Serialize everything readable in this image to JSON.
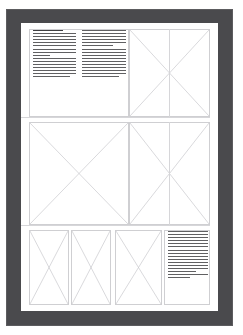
{
  "document": {
    "type": "page-layout-proof",
    "frame_color": "#4a4a4d",
    "page_color": "#ffffff",
    "guide_color": "#cfcfd2",
    "text_color": "#3d3d3f",
    "page_label": "",
    "canvas_width": 243,
    "canvas_height": 335
  },
  "text_blocks": [
    {
      "id": "top-left-column",
      "name": "body-column-left",
      "lines": [
        "How to build a team?",
        "The moment you start",
        "doing anything at all with",
        "another person, you've",
        "assembled a team. Begin",
        "a conversation, pick up",
        "the phone, brainstorm",
        "an idea and you're in",
        "teamwork.",
        "Start with Your ability to",
        "build better possibility",
        "is as leading the control",
        "to be versatile working",
        "longer on your ability to",
        "relate. But neither profit",
        "nor pressure are the"
      ]
    },
    {
      "id": "top-right-column",
      "name": "body-column-right",
      "lines": [
        "primary motivation for",
        "teamwork. Productive",
        "teamwork across our",
        "toward challenge,",
        "through design, with",
        "more confidence.",
        "Working well on any",
        "team generates energy",
        "and enthusiasm for life.",
        "Some are more skilled",
        "than Others. This ability",
        "is learned. You do not",
        "need complex structures",
        "formulas. You don't have",
        "to be easy-going, well-",
        "educated, hard-worked, or"
      ]
    },
    {
      "id": "bottom-right-column",
      "name": "body-column-bottom-right",
      "lines": [
        "even especially intelligent",
        "to build a team. You",
        "don't have to be anything",
        "other than yourself. You",
        "can be effective. But far",
        "richer team examples",
        "pour through the steps",
        "differently, so that way",
        "to greater commitment",
        "performance metrics.",
        "That you communicate",
        "presence is the same",
        "for team leaders and",
        "members. When",
        "two penalties a new",
        "commitment."
      ]
    }
  ],
  "grid": {
    "columns": 3,
    "rows": 3,
    "placeholder_label": "image-frame-placeholder",
    "diagonal_marks": true
  }
}
